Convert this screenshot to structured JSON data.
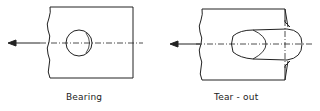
{
  "diagram": {
    "panels": [
      {
        "id": "bearing",
        "label": "Bearing"
      },
      {
        "id": "tear-out",
        "label": "Tear - out"
      }
    ],
    "colors": {
      "stroke": "#222222",
      "background": "#ffffff"
    }
  }
}
